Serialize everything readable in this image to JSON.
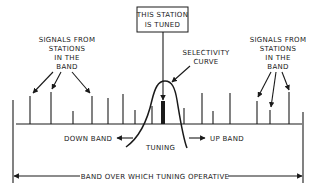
{
  "diagram": {
    "title_box": {
      "lines": [
        "THIS STATION",
        "IS TUNED"
      ]
    },
    "left_label": {
      "lines": [
        "SIGNALS FROM",
        "STATIONS",
        "IN THE",
        "BAND"
      ]
    },
    "right_label": {
      "lines": [
        "SIGNALS FROM",
        "STATIONS",
        "IN THE",
        "BAND"
      ]
    },
    "selectivity_label": {
      "lines": [
        "SELECTIVITY",
        "CURVE"
      ]
    },
    "down_band_label": "DOWN BAND",
    "up_band_label": "UP BAND",
    "tuning_label": "TUNING",
    "band_label": "BAND OVER WHICH TUNING OPERATIVE",
    "colors": {
      "ink": "#1a1a1a",
      "background": "#ffffff"
    }
  }
}
